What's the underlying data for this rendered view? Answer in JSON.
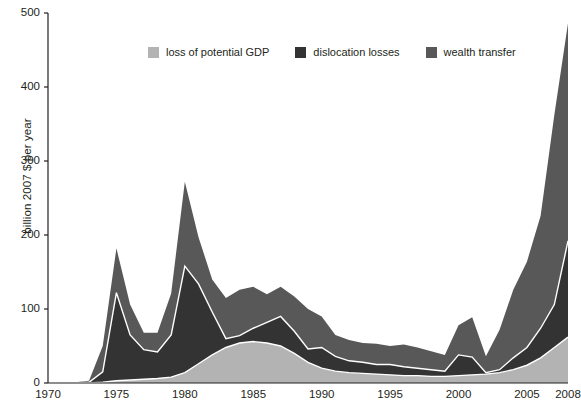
{
  "chart_data": {
    "type": "area",
    "stacked": true,
    "title": "",
    "xlabel": "",
    "ylabel": "billion 2007 $ per year",
    "xlim": [
      1970,
      2008
    ],
    "ylim": [
      0,
      500
    ],
    "ytick_labels": [
      "0",
      "100",
      "200",
      "300",
      "400",
      "500"
    ],
    "ytick_values": [
      0,
      100,
      200,
      300,
      400,
      500
    ],
    "xtick_labels": [
      "1970",
      "1975",
      "1980",
      "1985",
      "1990",
      "1995",
      "2000",
      "2005",
      "2008"
    ],
    "xtick_values": [
      1970,
      1975,
      1980,
      1985,
      1990,
      1995,
      2000,
      2005,
      2008
    ],
    "grid": false,
    "legend_position": "top-center",
    "x": [
      1970,
      1971,
      1972,
      1973,
      1974,
      1975,
      1976,
      1977,
      1978,
      1979,
      1980,
      1981,
      1982,
      1983,
      1984,
      1985,
      1986,
      1987,
      1988,
      1989,
      1990,
      1991,
      1992,
      1993,
      1994,
      1995,
      1996,
      1997,
      1998,
      1999,
      2000,
      2001,
      2002,
      2003,
      2004,
      2005,
      2006,
      2007,
      2008
    ],
    "series": [
      {
        "name": "loss of potential GDP",
        "color": "#b3b3b3",
        "values": [
          0,
          0,
          0,
          0,
          1,
          3,
          4,
          5,
          6,
          8,
          14,
          26,
          38,
          48,
          54,
          56,
          54,
          50,
          40,
          28,
          20,
          16,
          14,
          13,
          12,
          11,
          10,
          10,
          9,
          9,
          10,
          11,
          12,
          14,
          18,
          24,
          34,
          48,
          62
        ]
      },
      {
        "name": "dislocation losses",
        "color": "#333333",
        "values": [
          0,
          0,
          0,
          1,
          14,
          119,
          61,
          40,
          36,
          57,
          144,
          108,
          58,
          12,
          10,
          18,
          28,
          40,
          30,
          18,
          28,
          20,
          16,
          15,
          13,
          14,
          12,
          10,
          9,
          7,
          28,
          24,
          2,
          4,
          16,
          24,
          40,
          58,
          130
        ]
      },
      {
        "name": "wealth transfer",
        "color": "#585858",
        "values": [
          1,
          1,
          1,
          2,
          35,
          60,
          41,
          23,
          26,
          56,
          114,
          63,
          44,
          55,
          62,
          56,
          38,
          40,
          47,
          54,
          42,
          29,
          28,
          26,
          28,
          25,
          30,
          28,
          25,
          22,
          40,
          54,
          22,
          54,
          92,
          116,
          152,
          256,
          294
        ]
      }
    ],
    "totals_note": {
      "peak_1975": 182,
      "peak_1980": 272,
      "peak_2008": 486
    }
  },
  "legend": {
    "items": [
      {
        "label": "loss of potential GDP",
        "color": "#b3b3b3"
      },
      {
        "label": "dislocation losses",
        "color": "#333333"
      },
      {
        "label": "wealth transfer",
        "color": "#585858"
      }
    ]
  },
  "axes": {
    "y_axis_label": "billion 2007 $ per year",
    "separator_color": "#ffffff",
    "axis_color": "#231f20"
  }
}
